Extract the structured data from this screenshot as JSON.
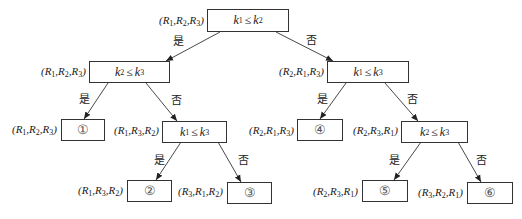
{
  "diagram": {
    "edge_labels": {
      "yes": "是",
      "no": "否"
    },
    "nodes": [
      {
        "id": "root",
        "type": "compare",
        "text": "k1≤k2",
        "lhs": "k",
        "lhs_sub": "1",
        "rhs": "k",
        "rhs_sub": "2",
        "tuple": [
          "R1",
          "R2",
          "R3"
        ]
      },
      {
        "id": "L",
        "type": "compare",
        "text": "k2≤k3",
        "lhs": "k",
        "lhs_sub": "2",
        "rhs": "k",
        "rhs_sub": "3",
        "tuple": [
          "R1",
          "R2",
          "R3"
        ]
      },
      {
        "id": "R",
        "type": "compare",
        "text": "k1≤k3",
        "lhs": "k",
        "lhs_sub": "1",
        "rhs": "k",
        "rhs_sub": "3",
        "tuple": [
          "R2",
          "R1",
          "R3"
        ]
      },
      {
        "id": "LL",
        "type": "leaf",
        "text": "①",
        "tuple": [
          "R1",
          "R2",
          "R3"
        ]
      },
      {
        "id": "LR",
        "type": "compare",
        "text": "k1≤k3",
        "lhs": "k",
        "lhs_sub": "1",
        "rhs": "k",
        "rhs_sub": "3",
        "tuple": [
          "R1",
          "R3",
          "R2"
        ]
      },
      {
        "id": "RL",
        "type": "leaf",
        "text": "④",
        "tuple": [
          "R2",
          "R1",
          "R3"
        ]
      },
      {
        "id": "RR",
        "type": "compare",
        "text": "k2≤k3",
        "lhs": "k",
        "lhs_sub": "2",
        "rhs": "k",
        "rhs_sub": "3",
        "tuple": [
          "R2",
          "R3",
          "R1"
        ]
      },
      {
        "id": "LRL",
        "type": "leaf",
        "text": "②",
        "tuple": [
          "R1",
          "R3",
          "R2"
        ]
      },
      {
        "id": "LRR",
        "type": "leaf",
        "text": "③",
        "tuple": [
          "R3",
          "R1",
          "R2"
        ]
      },
      {
        "id": "RRL",
        "type": "leaf",
        "text": "⑤",
        "tuple": [
          "R2",
          "R3",
          "R1"
        ]
      },
      {
        "id": "RRR",
        "type": "leaf",
        "text": "⑥",
        "tuple": [
          "R3",
          "R2",
          "R1"
        ]
      }
    ],
    "edges": [
      {
        "from": "root",
        "to": "L",
        "label": "是"
      },
      {
        "from": "root",
        "to": "R",
        "label": "否"
      },
      {
        "from": "L",
        "to": "LL",
        "label": "是"
      },
      {
        "from": "L",
        "to": "LR",
        "label": "否"
      },
      {
        "from": "R",
        "to": "RL",
        "label": "是"
      },
      {
        "from": "R",
        "to": "RR",
        "label": "否"
      },
      {
        "from": "LR",
        "to": "LRL",
        "label": "是"
      },
      {
        "from": "LR",
        "to": "LRR",
        "label": "否"
      },
      {
        "from": "RR",
        "to": "RRL",
        "label": "是"
      },
      {
        "from": "RR",
        "to": "RRR",
        "label": "否"
      }
    ]
  }
}
